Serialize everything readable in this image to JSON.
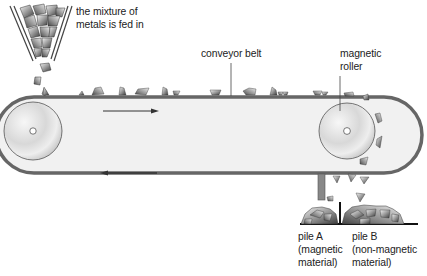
{
  "diagram": {
    "labels": {
      "feed": "the mixture of\nmetals is fed in",
      "conveyor_belt": "conveyor belt",
      "magnetic_roller": "magnetic\nroller",
      "pile_a": "pile A\n(magnetic\nmaterial)",
      "pile_b": "pile B\n(non-magnetic\nmaterial)"
    },
    "arrows": {
      "top_direction": "right",
      "bottom_direction": "left"
    },
    "colors": {
      "belt": "#6b6b6b",
      "belt_fill": "#f2f2f2",
      "roller": "#d9d9d9",
      "divider": "#111111",
      "chute": "#7a7a7a",
      "text": "#222222"
    }
  }
}
